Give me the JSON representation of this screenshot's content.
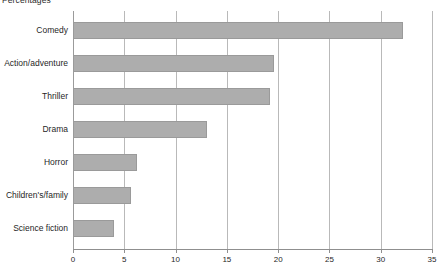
{
  "chart_data": {
    "type": "bar",
    "orientation": "horizontal",
    "title": "Percentages",
    "subtitle": "",
    "xlabel": "",
    "ylabel": "",
    "xlim": [
      0,
      35
    ],
    "xticks": [
      0,
      5,
      10,
      15,
      20,
      25,
      30,
      35
    ],
    "xtick_labels": [
      "0",
      "5",
      "10",
      "15",
      "20",
      "25",
      "30",
      "35"
    ],
    "grid": "vertical",
    "legend": "none",
    "categories": [
      "Comedy",
      "Action/adventure",
      "Thriller",
      "Drama",
      "Horror",
      "Children's/family",
      "Science fiction"
    ],
    "values": [
      32.2,
      19.6,
      19.2,
      13.1,
      6.2,
      5.7,
      4.0
    ],
    "bar_color": "#adadad",
    "bar_border_color": "#9a9a9a",
    "gridline_color": "#b9b9b9",
    "axis_color": "#8f8f8f",
    "background_color": "#ffffff"
  }
}
